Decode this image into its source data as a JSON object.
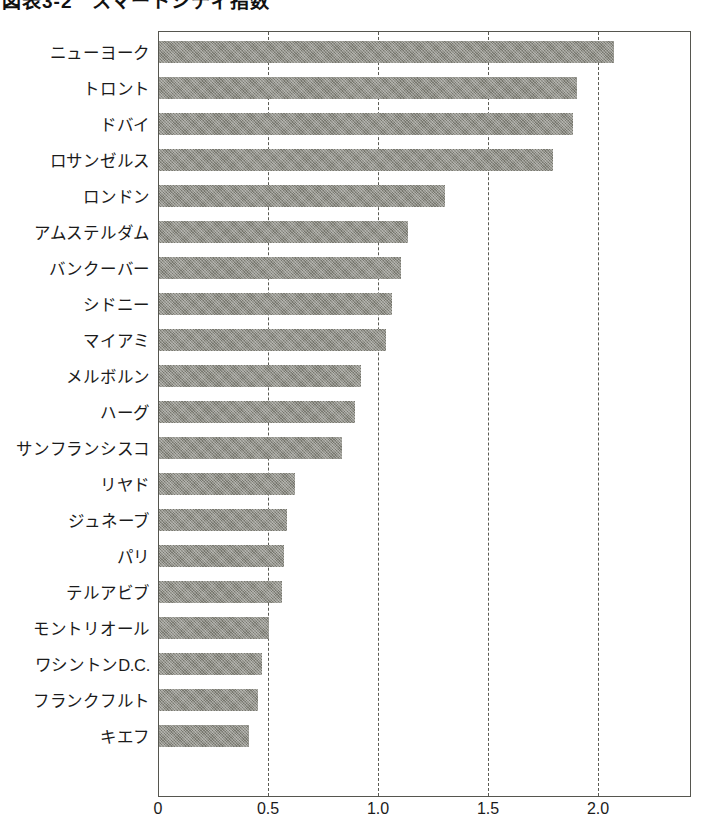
{
  "title": "図表3-2　スマートシティ指数",
  "chart_data": {
    "type": "bar",
    "orientation": "horizontal",
    "title": "図表3-2　スマートシティ指数",
    "xlabel": "",
    "ylabel": "",
    "xlim": [
      0,
      2.42
    ],
    "grid": true,
    "legend": false,
    "xticks": [
      "0",
      "0.5",
      "1.0",
      "1.5",
      "2.0"
    ],
    "xtick_values": [
      0,
      0.5,
      1.0,
      1.5,
      2.0
    ],
    "categories": [
      "ニューヨーク",
      "トロント",
      "ドバイ",
      "ロサンゼルス",
      "ロンドン",
      "アムステルダム",
      "バンクーバー",
      "シドニー",
      "マイアミ",
      "メルボルン",
      "ハーグ",
      "サンフランシスコ",
      "リヤド",
      "ジュネーブ",
      "パリ",
      "テルアビブ",
      "モントリオール",
      "ワシントンD.C.",
      "フランクフルト",
      "キエフ"
    ],
    "values": [
      2.07,
      1.9,
      1.88,
      1.79,
      1.3,
      1.13,
      1.1,
      1.06,
      1.03,
      0.92,
      0.89,
      0.83,
      0.62,
      0.58,
      0.57,
      0.56,
      0.5,
      0.47,
      0.45,
      0.41
    ],
    "bar_color": "#78786f",
    "frame_color": "#56564f",
    "grid_color": "#5a5a53"
  }
}
